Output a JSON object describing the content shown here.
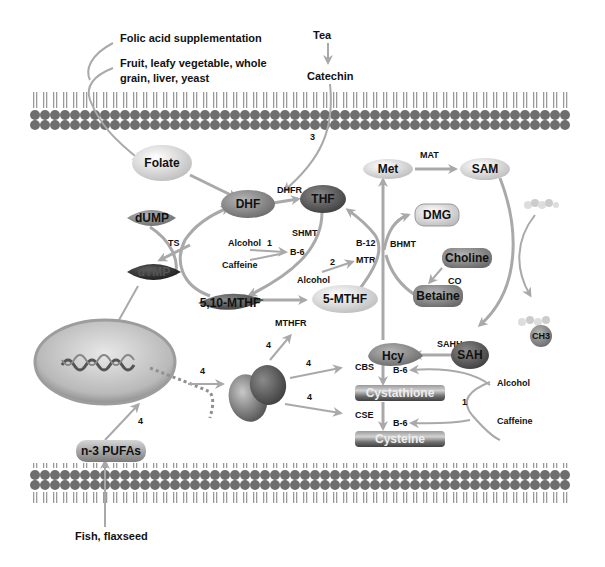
{
  "colors": {
    "arrow": "#a9a9a9",
    "membrane_bead": "#6e6e6e",
    "light_node": "#e4e4e4",
    "mid_node": "#8a8a8a",
    "dark_node": "#5a5a5a",
    "darkest_node": "#2e2e2e"
  },
  "sources": {
    "folic_acid": "Folic acid supplementation",
    "food_line1": "Fruit, leafy vegetable, whole",
    "food_line2": "grain, liver, yeast",
    "tea": "Tea",
    "catechin": "Catechin",
    "fish": "Fish, flaxseed"
  },
  "nodes": {
    "folate": "Folate",
    "dhf": "DHF",
    "thf": "THF",
    "dump": "dUMP",
    "dtmp": "dTMP",
    "mthf_510": "5,10-MTHF",
    "mthf_5": "5-MTHF",
    "met": "Met",
    "sam": "SAM",
    "dmg": "DMG",
    "choline": "Choline",
    "betaine": "Betaine",
    "sah": "SAH",
    "hcy": "Hcy",
    "cystathione": "Cystathione",
    "cysteine": "Cysteine",
    "pufas": "n-3 PUFAs",
    "ch3": "CH3"
  },
  "enzymes": {
    "dhfr": "DHFR",
    "shmt": "SHMT",
    "ts": "TS",
    "mthfr": "MTHFR",
    "mtr": "MTR",
    "b12": "B-12",
    "b6_mid": "B-6",
    "bhmt": "BHMT",
    "mat": "MAT",
    "co": "CO",
    "sahh": "SAHH",
    "cbs": "CBS",
    "cse": "CSE",
    "b6_cbs": "B-6",
    "b6_cse": "B-6"
  },
  "modifiers": {
    "alcohol_1": "Alcohol",
    "caffeine_1": "Caffeine",
    "alcohol_2": "Alcohol",
    "alcohol_right": "Alcohol",
    "caffeine_right": "Caffeine"
  },
  "markers": {
    "m3": "3",
    "m1_mid": "1",
    "m2": "2",
    "m1_right": "1",
    "m4_pufa": "4",
    "m4_nucleus": "4",
    "m4_mthfr": "4",
    "m4_cbs": "4",
    "m4_cse": "4"
  }
}
